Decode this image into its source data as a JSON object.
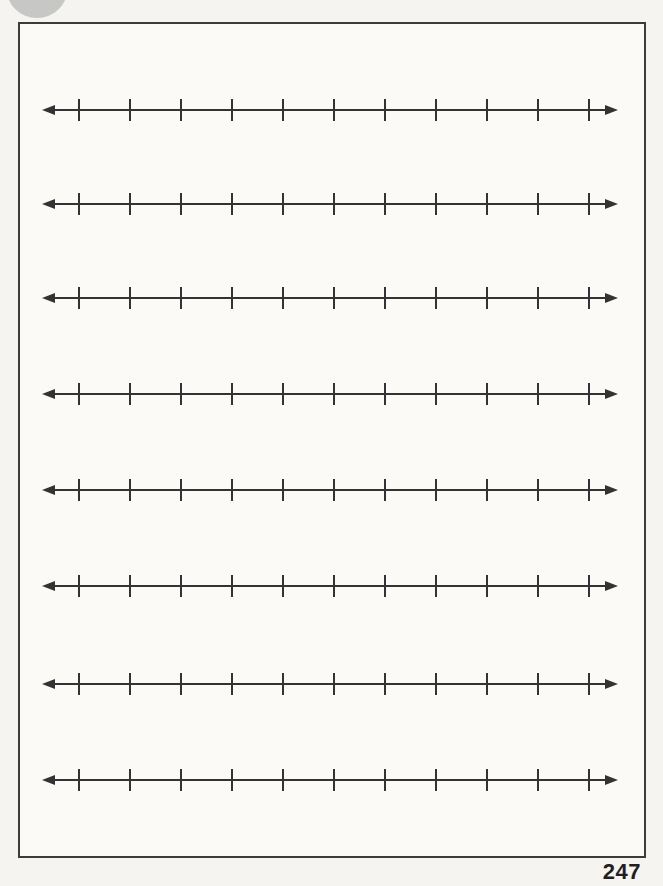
{
  "page": {
    "number": "247"
  },
  "number_lines": {
    "count": 8,
    "ticks_per_line": 11,
    "arrow_ends": "both"
  },
  "colors": {
    "ink": "#333333",
    "frame": "#3c3c3c",
    "paper": "#f5f4f0",
    "page_fill": "#fbfaf7"
  }
}
